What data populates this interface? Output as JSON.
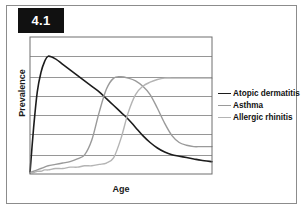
{
  "figure": {
    "number_label": "4.1",
    "number_box_color": "#111111",
    "number_text_color": "#ffffff",
    "border_color": "#8c8c8c",
    "background_color": "#ffffff"
  },
  "chart_data": {
    "type": "line",
    "title": "",
    "subtitle": "",
    "xlabel": "Age",
    "ylabel": "Prevalence",
    "xlim": [
      0,
      100
    ],
    "ylim": [
      0,
      100
    ],
    "grid": true,
    "grid_orientation": "horizontal",
    "gridline_count": 6,
    "gridline_values": [
      14,
      29,
      43,
      57,
      71,
      86
    ],
    "axis_ticks_shown": false,
    "legend_position": "right",
    "x": [
      0,
      2,
      4,
      6,
      8,
      10,
      14,
      18,
      22,
      26,
      30,
      34,
      38,
      42,
      46,
      50,
      54,
      58,
      62,
      66,
      70,
      74,
      78,
      82,
      86,
      90,
      94,
      100
    ],
    "series": [
      {
        "name": "Atopic dermatitis",
        "color": "#1c1c1c",
        "line_width": 1.6,
        "values": [
          1,
          34,
          60,
          74,
          82,
          86,
          84,
          80,
          76,
          72,
          68,
          64,
          60,
          55,
          50,
          45,
          40,
          34,
          28,
          23,
          19,
          16,
          14,
          13,
          12,
          11,
          10,
          9
        ]
      },
      {
        "name": "Asthma",
        "color": "#9a9a9a",
        "line_width": 1.4,
        "values": [
          1,
          2,
          3,
          4,
          5,
          6,
          7,
          8,
          9,
          11,
          14,
          25,
          45,
          62,
          70,
          71,
          70,
          68,
          64,
          58,
          48,
          37,
          28,
          23,
          21,
          20,
          20,
          20
        ]
      },
      {
        "name": "Allergic rhinitis",
        "color": "#b4b4b4",
        "line_width": 1.4,
        "values": [
          1,
          1,
          2,
          2,
          3,
          3,
          4,
          4,
          5,
          5,
          6,
          6,
          7,
          8,
          12,
          26,
          45,
          58,
          64,
          67,
          69,
          70,
          70,
          70,
          70,
          70,
          70,
          70
        ]
      }
    ],
    "legend": [
      {
        "label": "Atopic dermatitis",
        "color": "#1c1c1c",
        "line_width": 1.8
      },
      {
        "label": "Asthma",
        "color": "#9a9a9a",
        "line_width": 1.3
      },
      {
        "label": "Allergic rhinitis",
        "color": "#b4b4b4",
        "line_width": 1.3
      }
    ]
  }
}
